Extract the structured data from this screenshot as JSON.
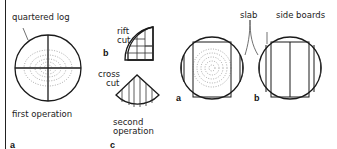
{
  "figure": {
    "left_panel": {
      "labels": {
        "quartered_log": "quartered log",
        "first_operation": "first operation",
        "rift_cut": [
          "rift",
          "cut"
        ],
        "cross_cut": [
          "cross",
          "cut"
        ],
        "second_operation": [
          "second",
          "operation"
        ]
      },
      "tags": {
        "a": "a",
        "b": "b",
        "c": "c"
      }
    },
    "right_panel": {
      "labels": {
        "slab": "slab",
        "side_boards": "side boards"
      },
      "tags": {
        "a": "a",
        "b": "b"
      }
    },
    "colors": {
      "ink": "#1a1a1a",
      "background": "#ffffff"
    }
  }
}
